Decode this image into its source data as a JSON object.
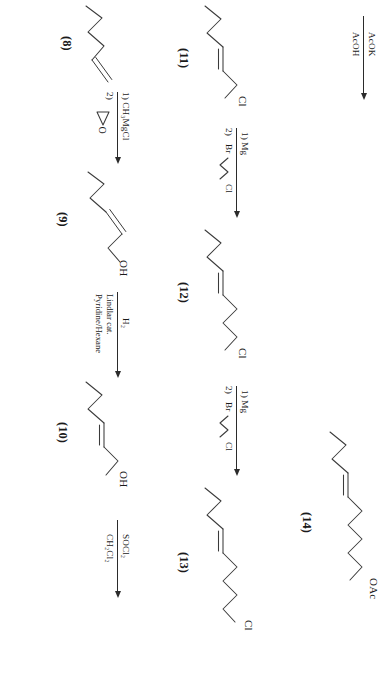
{
  "figure": {
    "type": "chemical-synthesis-scheme",
    "orientation": "rotated-90-ccw",
    "title": ""
  },
  "compounds": {
    "c8": {
      "label": "(8)",
      "terminus": ""
    },
    "c9": {
      "label": "(9)",
      "terminus": "OH"
    },
    "c10": {
      "label": "(10)",
      "terminus": "OH"
    },
    "c11": {
      "label": "(11)",
      "terminus": "Cl"
    },
    "c12": {
      "label": "(12)",
      "terminus": "Cl"
    },
    "c13": {
      "label": "(13)",
      "terminus": "Cl"
    },
    "c14": {
      "label": "(14)",
      "terminus": "OAc"
    }
  },
  "reactions": {
    "r8_9": {
      "above": "1)  CH₃MgCl",
      "below_step": "2)",
      "below_reagent": "ethylene-oxide"
    },
    "r9_10": {
      "above": "H₂",
      "below_line1": "Lindlar cat.",
      "below_line2": "Pyridine/Hexane"
    },
    "r10_11": {
      "above": "SOCl₂",
      "below": "CH₂Cl₂"
    },
    "r11_12": {
      "above": "1)  Mg",
      "below_step": "2)",
      "below_reagent": "Br",
      "below_reagent_tail": "Cl"
    },
    "r12_13": {
      "above": "1)  Mg",
      "below_step": "2)",
      "below_reagent": "Br",
      "below_reagent_tail": "Cl"
    },
    "r13_14": {
      "above": "AcOK",
      "below": "AcOH"
    }
  },
  "colors": {
    "bond": "#3a3a3a",
    "arrow": "#2b2b2b",
    "text": "#1a1a1a",
    "background": "#ffffff"
  }
}
